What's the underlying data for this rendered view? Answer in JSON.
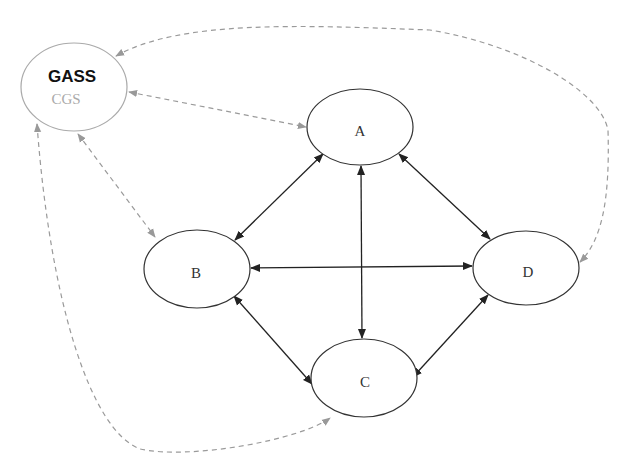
{
  "diagram": {
    "colors": {
      "solid_edge": "#222222",
      "dashed_edge": "#9a9a9a",
      "node_stroke": "#333333",
      "gass_stroke": "#aaaaaa"
    },
    "nodes": [
      {
        "id": "GASS",
        "label": "GASS",
        "sublabel": "CGS",
        "cx": 74,
        "cy": 87,
        "rx": 53,
        "ry": 44
      },
      {
        "id": "A",
        "label": "A",
        "cx": 360,
        "cy": 127,
        "rx": 53,
        "ry": 38
      },
      {
        "id": "B",
        "label": "B",
        "cx": 197,
        "cy": 269,
        "rx": 53,
        "ry": 39
      },
      {
        "id": "C",
        "label": "C",
        "cx": 364,
        "cy": 378,
        "rx": 53,
        "ry": 39
      },
      {
        "id": "D",
        "label": "D",
        "cx": 526,
        "cy": 268,
        "rx": 53,
        "ry": 37
      }
    ],
    "edges": [
      {
        "from": "A",
        "to": "B",
        "style": "solid",
        "direction": "both"
      },
      {
        "from": "A",
        "to": "C",
        "style": "solid",
        "direction": "both"
      },
      {
        "from": "A",
        "to": "D",
        "style": "solid",
        "direction": "both"
      },
      {
        "from": "B",
        "to": "D",
        "style": "solid",
        "direction": "both"
      },
      {
        "from": "B",
        "to": "C",
        "style": "solid",
        "direction": "both"
      },
      {
        "from": "C",
        "to": "D",
        "style": "solid",
        "direction": "both"
      },
      {
        "from": "GASS",
        "to": "A",
        "style": "dashed",
        "direction": "both"
      },
      {
        "from": "GASS",
        "to": "B",
        "style": "dashed",
        "direction": "both"
      },
      {
        "from": "GASS",
        "to": "C",
        "style": "dashed",
        "direction": "both"
      },
      {
        "from": "GASS",
        "to": "D",
        "style": "dashed",
        "direction": "both"
      }
    ]
  }
}
